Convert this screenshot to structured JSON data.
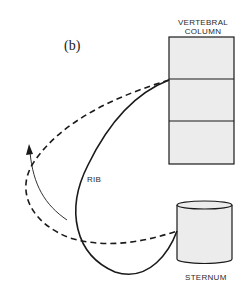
{
  "figure": {
    "panel_label": "(b)",
    "labels": {
      "vertebral_column_line1": "VERTEBRAL",
      "vertebral_column_line2": "COLUMN",
      "rib": "RIB",
      "sternum": "STERNUM"
    },
    "colors": {
      "stroke": "#1a1a1a",
      "fill": "#ececec",
      "background": "#ffffff"
    },
    "vertebral_column": {
      "segments": 3
    },
    "rib_positions": [
      "solid (rest)",
      "dashed (elevated)"
    ],
    "motion_arrow": "upward-outward rotation"
  }
}
